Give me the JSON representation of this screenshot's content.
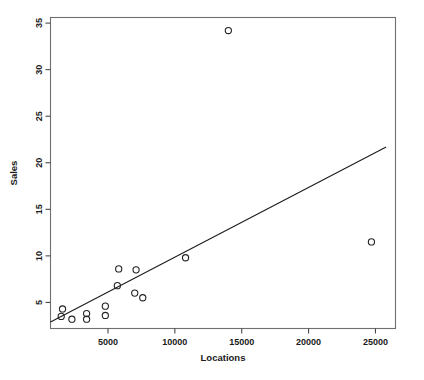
{
  "chart_data": {
    "type": "scatter",
    "title": "",
    "subtitle": "",
    "xlabel": "Locations",
    "ylabel": "Sales",
    "xlim": [
      700,
      26500
    ],
    "ylim": [
      2.2,
      35.6
    ],
    "grid": false,
    "legend": null,
    "legend_position": "none",
    "xticks": [
      5000,
      10000,
      15000,
      20000,
      25000
    ],
    "xtick_labels": [
      "5000",
      "10000",
      "15000",
      "20000",
      "25000"
    ],
    "yticks": [
      5,
      10,
      15,
      20,
      25,
      30,
      35
    ],
    "ytick_labels": [
      "5",
      "10",
      "15",
      "20",
      "25",
      "30",
      "35"
    ],
    "marker": "open-circle",
    "marker_color": "#222222",
    "points": [
      {
        "x": 1600,
        "y": 4.3
      },
      {
        "x": 1500,
        "y": 3.5
      },
      {
        "x": 2300,
        "y": 3.2
      },
      {
        "x": 3400,
        "y": 3.8
      },
      {
        "x": 3400,
        "y": 3.2
      },
      {
        "x": 4800,
        "y": 4.6
      },
      {
        "x": 4800,
        "y": 3.6
      },
      {
        "x": 5700,
        "y": 6.8
      },
      {
        "x": 5800,
        "y": 8.6
      },
      {
        "x": 7100,
        "y": 8.5
      },
      {
        "x": 7000,
        "y": 6.0
      },
      {
        "x": 7600,
        "y": 5.5
      },
      {
        "x": 10800,
        "y": 9.8
      },
      {
        "x": 14000,
        "y": 34.2
      },
      {
        "x": 24700,
        "y": 11.5
      }
    ],
    "trend_line": {
      "type": "linear-fit",
      "x_start": 700,
      "y_start": 2.9,
      "x_end": 25800,
      "y_end": 21.7,
      "color": "#1c1c1c"
    }
  },
  "axes": {
    "x_axis_label": "Locations",
    "y_axis_label": "Sales"
  }
}
